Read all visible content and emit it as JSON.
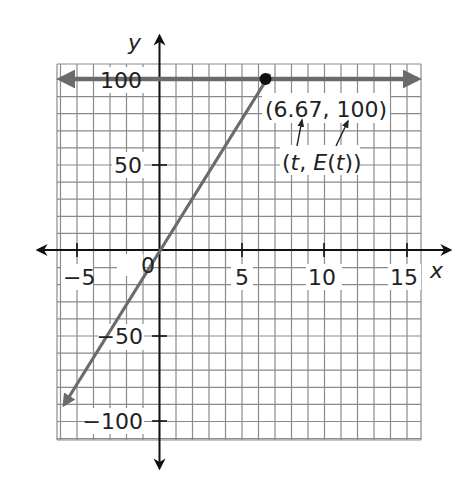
{
  "chart_data": {
    "type": "line",
    "title": "",
    "xlabel": "x",
    "ylabel": "y",
    "xlim": [
      -6.2,
      15.8
    ],
    "ylim": [
      -111,
      109
    ],
    "grid": true,
    "grid_step": {
      "x": 1,
      "y": 10
    },
    "x_ticks": [
      -5,
      0,
      5,
      10,
      15
    ],
    "x_tick_labels": [
      "−5",
      "0",
      "5",
      "10",
      "15"
    ],
    "y_ticks": [
      -100,
      -50,
      50,
      100
    ],
    "y_tick_labels": [
      "−100",
      "−50",
      "50",
      "100"
    ],
    "series": [
      {
        "name": "E(t) = 15t (rising line)",
        "x": [
          -6.0,
          6.67
        ],
        "y": [
          -90,
          100
        ],
        "arrow_start": true,
        "color": "#6b6b6b"
      },
      {
        "name": "y = 100 (horizontal line)",
        "x": [
          -6.2,
          15.5
        ],
        "y": [
          100,
          100
        ],
        "arrow_start": true,
        "arrow_end": true,
        "color": "#6b6b6b"
      }
    ],
    "points": [
      {
        "x": 6.67,
        "y": 100,
        "label": "(6.67, 100)"
      }
    ],
    "annotations": [
      {
        "text": "(6.67, 100)",
        "x": 9.5,
        "y": 88
      },
      {
        "text": "(t, E(t))",
        "x": 9.5,
        "y": 62
      }
    ]
  },
  "labels": {
    "x_axis": "x",
    "y_axis": "y",
    "point_label": "(6.67, 100)",
    "generic_label_open": "(",
    "generic_label_t": "t",
    "generic_label_comma": ", ",
    "generic_label_E": "E",
    "generic_label_paren": "(",
    "generic_label_t2": "t",
    "generic_label_close": "))",
    "tick_x_neg5": "−5",
    "tick_x_0": "0",
    "tick_x_5": "5",
    "tick_x_10": "10",
    "tick_x_15": "15",
    "tick_y_100": "100",
    "tick_y_50": "50",
    "tick_y_neg50": "−50",
    "tick_y_neg100": "−100"
  }
}
